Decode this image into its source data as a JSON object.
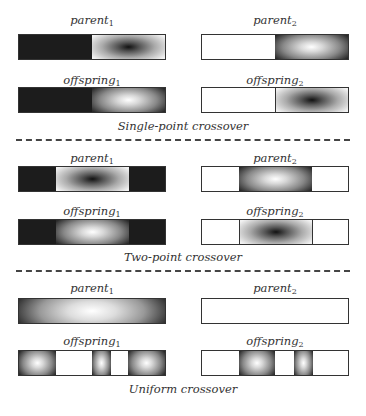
{
  "sections": [
    {
      "caption": "Single-point crossover",
      "parent1": {
        "label": "parent",
        "sub": "1"
      },
      "parent2": {
        "label": "parent",
        "sub": "2"
      },
      "offspring1": {
        "label": "offspring",
        "sub": "1"
      },
      "offspring2": {
        "label": "offspring",
        "sub": "2"
      },
      "segments": {
        "parent1": [
          {
            "w": 50,
            "fill": "dark"
          },
          {
            "w": 50,
            "fill": "grad-dark-center"
          }
        ],
        "parent2": [
          {
            "w": 50,
            "fill": "white"
          },
          {
            "w": 50,
            "fill": "grad-light-center"
          }
        ],
        "offspring1": [
          {
            "w": 50,
            "fill": "dark"
          },
          {
            "w": 50,
            "fill": "grad-light-center"
          }
        ],
        "offspring2": [
          {
            "w": 50,
            "fill": "white"
          },
          {
            "w": 50,
            "fill": "grad-dark-center",
            "divider": true
          }
        ]
      }
    },
    {
      "caption": "Two-point crossover",
      "parent1": {
        "label": "parent",
        "sub": "1"
      },
      "parent2": {
        "label": "parent",
        "sub": "2"
      },
      "offspring1": {
        "label": "offspring",
        "sub": "1"
      },
      "offspring2": {
        "label": "offspring",
        "sub": "2"
      },
      "segments": {
        "parent1": [
          {
            "w": 25,
            "fill": "dark"
          },
          {
            "w": 50,
            "fill": "grad-dark-center"
          },
          {
            "w": 25,
            "fill": "dark"
          }
        ],
        "parent2": [
          {
            "w": 25,
            "fill": "white"
          },
          {
            "w": 50,
            "fill": "grad-light-center"
          },
          {
            "w": 25,
            "fill": "white"
          }
        ],
        "offspring1": [
          {
            "w": 25,
            "fill": "dark"
          },
          {
            "w": 50,
            "fill": "grad-light-center"
          },
          {
            "w": 25,
            "fill": "dark"
          }
        ],
        "offspring2": [
          {
            "w": 25,
            "fill": "white"
          },
          {
            "w": 50,
            "fill": "grad-dark-center",
            "divider": true
          },
          {
            "w": 25,
            "fill": "white",
            "divider": true
          }
        ]
      }
    },
    {
      "caption": "Uniform crossover",
      "parent1": {
        "label": "parent",
        "sub": "1"
      },
      "parent2": {
        "label": "parent",
        "sub": "2"
      },
      "offspring1": {
        "label": "offspring",
        "sub": "1"
      },
      "offspring2": {
        "label": "offspring",
        "sub": "2"
      },
      "segments": {
        "parent1": [
          {
            "w": 100,
            "fill": "grad-light-wide"
          }
        ],
        "parent2": [
          {
            "w": 100,
            "fill": "white"
          }
        ],
        "offspring1": [
          {
            "w": 25,
            "fill": "grad-light-center"
          },
          {
            "w": 25,
            "fill": "white"
          },
          {
            "w": 13,
            "fill": "grad-light-center"
          },
          {
            "w": 12,
            "fill": "white"
          },
          {
            "w": 25,
            "fill": "grad-light-center"
          }
        ],
        "offspring2": [
          {
            "w": 25,
            "fill": "white"
          },
          {
            "w": 25,
            "fill": "grad-light-center"
          },
          {
            "w": 13,
            "fill": "white"
          },
          {
            "w": 13,
            "fill": "grad-light-center"
          },
          {
            "w": 24,
            "fill": "white"
          }
        ]
      }
    }
  ],
  "colors": {
    "dark": "#1c1c1c",
    "outline": "#333333",
    "dash": "#444444"
  }
}
